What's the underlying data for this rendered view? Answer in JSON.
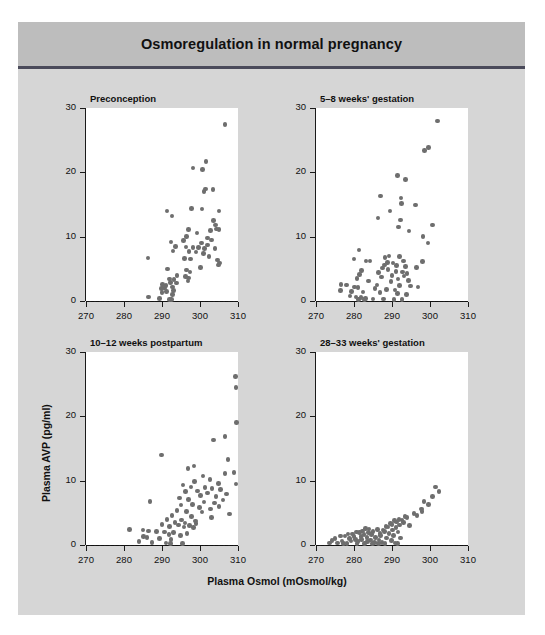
{
  "figure": {
    "title": "Osmoregulation in normal pregnancy",
    "background_color": "#d6d6d6",
    "title_band_color": "#bdbdbd",
    "rule_color": "#4a4a5a"
  },
  "axes": {
    "xlabel": "Plasma Osmol (mOsmol/kg)",
    "ylabel": "Plasma AVP (pg/ml)",
    "xticks": [
      "270",
      "280",
      "290",
      "300",
      "310"
    ],
    "yticks": [
      "0",
      "10",
      "20",
      "30"
    ],
    "xlim": [
      270,
      310
    ],
    "ylim": [
      0,
      30
    ],
    "point_color": "#6e6e6e",
    "zero_line": "dashed at y=0"
  },
  "chart_data": [
    {
      "type": "scatter",
      "title": "Preconception",
      "xlabel": "Plasma Osmol (mOsmol/kg)",
      "ylabel": "Plasma AVP (pg/ml)",
      "xlim": [
        270,
        310
      ],
      "ylim": [
        0,
        30
      ],
      "xticks": [
        270,
        280,
        290,
        300,
        310
      ],
      "yticks": [
        0,
        10,
        20,
        30
      ],
      "grid": false,
      "legend": "none",
      "points": [
        [
          306.6,
          27.4
        ],
        [
          301.6,
          21.7
        ],
        [
          298.2,
          20.7
        ],
        [
          300.6,
          20.4
        ],
        [
          301.4,
          17.4
        ],
        [
          303.4,
          17.3
        ],
        [
          301.1,
          17.0
        ],
        [
          297.8,
          14.4
        ],
        [
          300.5,
          14.3
        ],
        [
          305.0,
          14.0
        ],
        [
          291.3,
          14.0
        ],
        [
          292.6,
          13.2
        ],
        [
          303.5,
          12.5
        ],
        [
          304.1,
          11.8
        ],
        [
          304.3,
          11.2
        ],
        [
          305.0,
          11.1
        ],
        [
          296.9,
          11.1
        ],
        [
          302.7,
          11.0
        ],
        [
          299.2,
          10.6
        ],
        [
          296.4,
          10.0
        ],
        [
          301.9,
          9.8
        ],
        [
          303.0,
          9.5
        ],
        [
          295.6,
          9.4
        ],
        [
          292.4,
          9.2
        ],
        [
          300.4,
          9.0
        ],
        [
          302.0,
          8.7
        ],
        [
          293.5,
          8.5
        ],
        [
          296.3,
          8.4
        ],
        [
          298.2,
          8.3
        ],
        [
          299.6,
          8.3
        ],
        [
          301.2,
          8.2
        ],
        [
          303.9,
          8.2
        ],
        [
          292.9,
          7.8
        ],
        [
          297.1,
          7.7
        ],
        [
          299.0,
          7.6
        ],
        [
          300.9,
          7.4
        ],
        [
          302.4,
          6.9
        ],
        [
          286.3,
          6.7
        ],
        [
          295.9,
          6.6
        ],
        [
          297.5,
          6.5
        ],
        [
          304.6,
          6.4
        ],
        [
          305.2,
          5.9
        ],
        [
          304.8,
          5.6
        ],
        [
          300.2,
          5.2
        ],
        [
          291.5,
          5.0
        ],
        [
          296.5,
          4.8
        ],
        [
          297.4,
          4.5
        ],
        [
          294.0,
          4.0
        ],
        [
          296.2,
          3.8
        ],
        [
          297.0,
          3.6
        ],
        [
          291.9,
          3.4
        ],
        [
          293.2,
          3.3
        ],
        [
          296.8,
          3.1
        ],
        [
          292.2,
          2.9
        ],
        [
          293.8,
          2.8
        ],
        [
          290.2,
          2.6
        ],
        [
          291.0,
          2.4
        ],
        [
          292.7,
          2.2
        ],
        [
          290.6,
          2.0
        ],
        [
          289.8,
          1.9
        ],
        [
          293.0,
          1.6
        ],
        [
          291.2,
          1.5
        ],
        [
          290.0,
          1.3
        ],
        [
          292.8,
          1.0
        ],
        [
          286.5,
          0.6
        ],
        [
          289.4,
          0.4
        ],
        [
          292.0,
          0.2
        ],
        [
          292.5,
          0.2
        ]
      ]
    },
    {
      "type": "scatter",
      "title": "5–8 weeks' gestation",
      "xlabel": "Plasma Osmol (mOsmol/kg)",
      "ylabel": "Plasma AVP (pg/ml)",
      "xlim": [
        270,
        310
      ],
      "ylim": [
        0,
        30
      ],
      "xticks": [
        270,
        280,
        290,
        300,
        310
      ],
      "yticks": [
        0,
        10,
        20,
        30
      ],
      "grid": false,
      "legend": "none",
      "points": [
        [
          302.0,
          28.0
        ],
        [
          299.6,
          23.9
        ],
        [
          298.6,
          23.4
        ],
        [
          291.5,
          19.5
        ],
        [
          293.6,
          18.9
        ],
        [
          287.0,
          16.3
        ],
        [
          292.4,
          16.0
        ],
        [
          292.5,
          15.2
        ],
        [
          296.2,
          14.9
        ],
        [
          289.5,
          14.0
        ],
        [
          286.3,
          12.9
        ],
        [
          292.3,
          12.6
        ],
        [
          300.6,
          11.8
        ],
        [
          291.7,
          11.5
        ],
        [
          294.5,
          10.9
        ],
        [
          298.2,
          10.0
        ],
        [
          299.5,
          9.0
        ],
        [
          281.3,
          7.9
        ],
        [
          289.2,
          7.0
        ],
        [
          291.9,
          6.9
        ],
        [
          288.2,
          6.8
        ],
        [
          280.0,
          6.5
        ],
        [
          283.2,
          6.2
        ],
        [
          284.2,
          6.2
        ],
        [
          293.0,
          6.2
        ],
        [
          298.0,
          6.1
        ],
        [
          288.8,
          6.0
        ],
        [
          290.3,
          5.9
        ],
        [
          288.0,
          5.6
        ],
        [
          291.2,
          5.5
        ],
        [
          293.5,
          5.4
        ],
        [
          296.4,
          5.2
        ],
        [
          287.5,
          5.1
        ],
        [
          289.0,
          4.9
        ],
        [
          282.0,
          4.7
        ],
        [
          291.0,
          4.6
        ],
        [
          292.8,
          4.5
        ],
        [
          286.5,
          4.4
        ],
        [
          294.0,
          4.3
        ],
        [
          281.5,
          4.1
        ],
        [
          290.0,
          4.0
        ],
        [
          293.2,
          3.9
        ],
        [
          287.2,
          3.7
        ],
        [
          280.8,
          3.5
        ],
        [
          291.6,
          3.4
        ],
        [
          294.3,
          3.2
        ],
        [
          283.8,
          3.1
        ],
        [
          289.7,
          3.0
        ],
        [
          276.6,
          2.6
        ],
        [
          278.0,
          2.5
        ],
        [
          286.0,
          2.5
        ],
        [
          292.0,
          2.4
        ],
        [
          294.8,
          2.3
        ],
        [
          296.8,
          2.2
        ],
        [
          280.2,
          2.2
        ],
        [
          281.0,
          2.1
        ],
        [
          285.5,
          1.9
        ],
        [
          288.5,
          1.8
        ],
        [
          290.8,
          1.7
        ],
        [
          276.4,
          1.6
        ],
        [
          279.4,
          1.5
        ],
        [
          282.4,
          1.4
        ],
        [
          286.8,
          1.3
        ],
        [
          291.4,
          1.2
        ],
        [
          293.8,
          1.0
        ],
        [
          279.0,
          0.8
        ],
        [
          280.5,
          0.6
        ],
        [
          281.8,
          0.5
        ],
        [
          283.0,
          0.4
        ],
        [
          285.0,
          0.3
        ],
        [
          287.8,
          0.3
        ],
        [
          290.5,
          0.2
        ],
        [
          292.6,
          0.2
        ],
        [
          281.2,
          0.2
        ],
        [
          282.8,
          0.2
        ]
      ]
    },
    {
      "type": "scatter",
      "title": "10–12 weeks postpartum",
      "xlabel": "Plasma Osmol (mOsmol/kg)",
      "ylabel": "Plasma AVP (pg/ml)",
      "xlim": [
        270,
        310
      ],
      "ylim": [
        0,
        30
      ],
      "xticks": [
        270,
        280,
        290,
        300,
        310
      ],
      "yticks": [
        0,
        10,
        20,
        30
      ],
      "grid": false,
      "legend": "none",
      "points": [
        [
          309.3,
          26.2
        ],
        [
          309.5,
          24.5
        ],
        [
          309.6,
          19.0
        ],
        [
          306.6,
          16.9
        ],
        [
          303.5,
          16.3
        ],
        [
          289.8,
          14.0
        ],
        [
          307.4,
          13.3
        ],
        [
          298.4,
          12.3
        ],
        [
          296.8,
          11.9
        ],
        [
          309.0,
          11.3
        ],
        [
          306.6,
          11.1
        ],
        [
          300.8,
          10.7
        ],
        [
          302.6,
          10.2
        ],
        [
          298.6,
          9.9
        ],
        [
          304.8,
          9.6
        ],
        [
          309.5,
          9.5
        ],
        [
          295.5,
          9.3
        ],
        [
          297.6,
          9.0
        ],
        [
          301.3,
          8.9
        ],
        [
          303.2,
          8.8
        ],
        [
          305.4,
          8.6
        ],
        [
          299.4,
          8.4
        ],
        [
          296.2,
          8.3
        ],
        [
          302.0,
          8.1
        ],
        [
          307.0,
          7.9
        ],
        [
          300.2,
          7.7
        ],
        [
          304.2,
          7.5
        ],
        [
          294.6,
          7.3
        ],
        [
          297.0,
          7.1
        ],
        [
          306.0,
          7.0
        ],
        [
          286.8,
          6.8
        ],
        [
          301.0,
          6.7
        ],
        [
          303.8,
          6.5
        ],
        [
          298.0,
          6.3
        ],
        [
          295.0,
          6.2
        ],
        [
          305.0,
          6.0
        ],
        [
          299.8,
          5.8
        ],
        [
          302.8,
          5.6
        ],
        [
          294.0,
          5.4
        ],
        [
          296.4,
          5.2
        ],
        [
          300.5,
          5.1
        ],
        [
          307.8,
          4.8
        ],
        [
          292.6,
          4.6
        ],
        [
          297.8,
          4.4
        ],
        [
          303.0,
          4.3
        ],
        [
          291.3,
          4.0
        ],
        [
          295.2,
          3.9
        ],
        [
          298.8,
          3.7
        ],
        [
          293.4,
          3.5
        ],
        [
          296.0,
          3.4
        ],
        [
          299.0,
          3.3
        ],
        [
          290.0,
          3.2
        ],
        [
          294.4,
          3.1
        ],
        [
          297.2,
          3.0
        ],
        [
          292.0,
          2.9
        ],
        [
          295.8,
          2.8
        ],
        [
          298.3,
          2.7
        ],
        [
          281.5,
          2.4
        ],
        [
          285.0,
          2.3
        ],
        [
          286.4,
          2.2
        ],
        [
          288.6,
          2.1
        ],
        [
          290.6,
          2.0
        ],
        [
          293.0,
          1.9
        ],
        [
          296.6,
          1.8
        ],
        [
          291.8,
          1.6
        ],
        [
          294.8,
          1.5
        ],
        [
          285.2,
          1.3
        ],
        [
          286.0,
          1.2
        ],
        [
          289.4,
          1.0
        ],
        [
          292.4,
          0.9
        ],
        [
          284.0,
          0.5
        ],
        [
          287.4,
          0.4
        ],
        [
          291.0,
          0.3
        ],
        [
          292.2,
          0.2
        ],
        [
          295.4,
          0.2
        ]
      ]
    },
    {
      "type": "scatter",
      "title": "28–33 weeks' gestation",
      "xlabel": "Plasma Osmol (mOsmol/kg)",
      "ylabel": "Plasma AVP (pg/ml)",
      "xlim": [
        270,
        310
      ],
      "ylim": [
        0,
        30
      ],
      "xticks": [
        270,
        280,
        290,
        300,
        310
      ],
      "yticks": [
        0,
        10,
        20,
        30
      ],
      "grid": false,
      "legend": "none",
      "points": [
        [
          301.4,
          9.0
        ],
        [
          302.4,
          8.3
        ],
        [
          300.6,
          7.5
        ],
        [
          298.4,
          6.8
        ],
        [
          299.6,
          6.3
        ],
        [
          297.8,
          5.6
        ],
        [
          297.9,
          5.2
        ],
        [
          295.8,
          4.9
        ],
        [
          296.6,
          4.6
        ],
        [
          293.4,
          4.4
        ],
        [
          294.0,
          4.3
        ],
        [
          291.8,
          4.0
        ],
        [
          292.6,
          3.9
        ],
        [
          290.6,
          3.8
        ],
        [
          291.2,
          3.6
        ],
        [
          293.0,
          3.5
        ],
        [
          289.6,
          3.3
        ],
        [
          290.0,
          3.2
        ],
        [
          292.0,
          3.1
        ],
        [
          294.6,
          3.0
        ],
        [
          288.4,
          2.9
        ],
        [
          289.0,
          2.8
        ],
        [
          291.0,
          2.7
        ],
        [
          283.0,
          2.6
        ],
        [
          284.0,
          2.5
        ],
        [
          286.2,
          2.4
        ],
        [
          287.6,
          2.3
        ],
        [
          290.2,
          2.3
        ],
        [
          282.2,
          2.2
        ],
        [
          285.0,
          2.1
        ],
        [
          288.0,
          2.1
        ],
        [
          291.6,
          2.0
        ],
        [
          280.6,
          2.0
        ],
        [
          281.4,
          1.9
        ],
        [
          283.8,
          1.9
        ],
        [
          286.8,
          1.8
        ],
        [
          289.2,
          1.8
        ],
        [
          278.4,
          1.7
        ],
        [
          279.6,
          1.7
        ],
        [
          282.6,
          1.6
        ],
        [
          284.6,
          1.6
        ],
        [
          287.0,
          1.5
        ],
        [
          290.4,
          1.5
        ],
        [
          276.4,
          1.4
        ],
        [
          277.6,
          1.4
        ],
        [
          280.0,
          1.3
        ],
        [
          281.8,
          1.3
        ],
        [
          283.4,
          1.2
        ],
        [
          285.6,
          1.2
        ],
        [
          288.6,
          1.1
        ],
        [
          292.2,
          1.1
        ],
        [
          275.0,
          1.0
        ],
        [
          278.8,
          1.0
        ],
        [
          280.4,
          0.9
        ],
        [
          282.0,
          0.9
        ],
        [
          284.4,
          0.8
        ],
        [
          286.6,
          0.8
        ],
        [
          289.8,
          0.7
        ],
        [
          274.2,
          0.7
        ],
        [
          276.8,
          0.6
        ],
        [
          279.2,
          0.6
        ],
        [
          281.0,
          0.5
        ],
        [
          283.6,
          0.5
        ],
        [
          285.4,
          0.4
        ],
        [
          287.4,
          0.4
        ],
        [
          290.8,
          0.3
        ],
        [
          273.6,
          0.3
        ],
        [
          275.6,
          0.3
        ],
        [
          277.2,
          0.2
        ],
        [
          278.2,
          0.2
        ],
        [
          280.8,
          0.2
        ],
        [
          282.8,
          0.2
        ],
        [
          284.8,
          0.2
        ],
        [
          286.4,
          0.2
        ],
        [
          288.2,
          0.2
        ],
        [
          291.4,
          0.2
        ]
      ]
    }
  ]
}
